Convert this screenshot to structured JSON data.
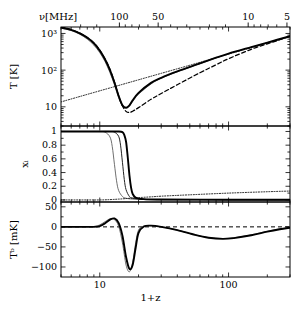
{
  "figure": {
    "type": "multi-panel-line-plot",
    "panels": 3,
    "xlabel": "1+z",
    "top_axis_label": "ν[MHz]"
  },
  "top_axis": {
    "label": "ν[MHz]",
    "ticks": [
      {
        "value": 500,
        "label": "500"
      },
      {
        "value": 100,
        "label": "100"
      },
      {
        "value": 50,
        "label": "50"
      },
      {
        "value": 10,
        "label": "10"
      },
      {
        "value": 5,
        "label": "5"
      }
    ]
  },
  "bottom_axis": {
    "label": "1+z",
    "ticks": [
      {
        "value": 10,
        "label": "10"
      },
      {
        "value": 100,
        "label": "100"
      }
    ],
    "range": [
      5,
      300
    ],
    "scale": "log"
  },
  "chart_data": [
    {
      "type": "line",
      "panel": "top",
      "title": "",
      "ylabel": "T [K]",
      "xlabel": "1+z",
      "xscale": "log",
      "yscale": "log",
      "xlim": [
        5,
        300
      ],
      "ylim": [
        3,
        1500
      ],
      "ytick_labels": [
        "10³",
        "10²",
        "10",
        ""
      ],
      "ytick_values": [
        1000,
        100,
        10,
        3
      ],
      "grid": false,
      "legend": "none",
      "series": [
        {
          "name": "T_CMB",
          "style": "dotted",
          "comment": "CMB temperature, linear in (1+z)",
          "x": [
            5,
            7,
            10,
            15,
            20,
            30,
            50,
            70,
            100,
            150,
            200,
            300
          ],
          "y": [
            13.6,
            19.1,
            27.3,
            40.9,
            54.5,
            81.8,
            136,
            191,
            273,
            409,
            545,
            818
          ]
        },
        {
          "name": "T_K-model-A",
          "style": "solid-thin",
          "comment": "gas kinetic temperature, grey thin line",
          "x": [
            5,
            6,
            7,
            8,
            9,
            10,
            11,
            12,
            13,
            14,
            15,
            16,
            17,
            18,
            20,
            25,
            30,
            40,
            60,
            80,
            100,
            150,
            200,
            300
          ],
          "y": [
            1400,
            1200,
            950,
            700,
            480,
            300,
            170,
            85,
            40,
            18,
            10.5,
            9.0,
            10.5,
            14,
            22,
            42,
            60,
            90,
            150,
            215,
            280,
            420,
            560,
            840
          ]
        },
        {
          "name": "T_K-model-B",
          "style": "solid-thick",
          "comment": "gas kinetic temperature, heavy black line",
          "x": [
            5,
            6,
            7,
            8,
            9,
            10,
            11,
            12,
            13,
            14,
            15,
            16,
            17,
            18,
            20,
            25,
            30,
            40,
            60,
            80,
            100,
            150,
            200,
            300
          ],
          "y": [
            1450,
            1250,
            1000,
            760,
            540,
            340,
            195,
            100,
            46,
            20,
            11,
            9.5,
            11,
            15,
            24,
            45,
            62,
            92,
            152,
            218,
            282,
            425,
            565,
            850
          ]
        },
        {
          "name": "T_K-adiabatic",
          "style": "dashed",
          "comment": "adiabatic cooling, no heating; deepest minimum",
          "x": [
            5,
            6,
            7,
            8,
            9,
            10,
            11,
            12,
            13,
            14,
            15,
            16,
            17,
            18,
            20,
            25,
            30,
            40,
            60,
            80,
            100,
            150,
            200,
            300
          ],
          "y": [
            1500,
            1280,
            1020,
            780,
            550,
            350,
            200,
            105,
            48,
            20,
            10.5,
            7.5,
            7.0,
            7.6,
            9.5,
            16,
            23,
            40,
            85,
            140,
            205,
            370,
            520,
            830
          ]
        }
      ]
    },
    {
      "type": "line",
      "panel": "middle",
      "title": "",
      "ylabel": "xᵢ",
      "xlabel": "1+z",
      "xscale": "log",
      "yscale": "linear",
      "xlim": [
        5,
        300
      ],
      "ylim": [
        -0.03,
        1.08
      ],
      "ytick_labels": [
        "1",
        "0.8",
        "0.6",
        "0.4",
        "0.2",
        "0"
      ],
      "ytick_values": [
        1,
        0.8,
        0.6,
        0.4,
        0.2,
        0
      ],
      "grid": false,
      "legend": "none",
      "series": [
        {
          "name": "x_i-model-A",
          "style": "solid-thin",
          "comment": "ionized fraction, earliest decline",
          "x": [
            5,
            8,
            10,
            11,
            12,
            12.5,
            13,
            13.5,
            14,
            15,
            16,
            18,
            22,
            30,
            60,
            150,
            300
          ],
          "y": [
            1.0,
            1.0,
            1.0,
            0.99,
            0.92,
            0.78,
            0.52,
            0.28,
            0.14,
            0.05,
            0.025,
            0.012,
            0.006,
            0.003,
            0.002,
            0.0015,
            0.001
          ]
        },
        {
          "name": "x_i-model-B",
          "style": "solid-thin2",
          "x": [
            5,
            8,
            10,
            12,
            13,
            14,
            14.5,
            15,
            15.5,
            16,
            17,
            18,
            22,
            30,
            60,
            150,
            300
          ],
          "y": [
            1.0,
            1.0,
            1.0,
            1.0,
            0.99,
            0.93,
            0.8,
            0.55,
            0.3,
            0.15,
            0.05,
            0.025,
            0.01,
            0.005,
            0.003,
            0.002,
            0.0015
          ]
        },
        {
          "name": "x_i-model-C",
          "style": "solid-thick",
          "x": [
            5,
            8,
            10,
            12,
            14,
            15,
            15.5,
            16,
            16.5,
            17,
            17.5,
            18,
            19,
            22,
            30,
            60,
            150,
            300
          ],
          "y": [
            1.0,
            1.0,
            1.0,
            1.0,
            1.0,
            0.99,
            0.95,
            0.85,
            0.62,
            0.36,
            0.18,
            0.09,
            0.035,
            0.012,
            0.006,
            0.004,
            0.003,
            0.002
          ]
        },
        {
          "name": "x_i-residual",
          "style": "dotted",
          "comment": "faint residual electron fraction floor",
          "x": [
            5,
            8,
            10,
            12,
            14,
            16,
            18,
            20,
            25,
            30,
            50,
            100,
            200,
            300
          ],
          "y": [
            0.0,
            0.0,
            0.0,
            0.005,
            0.012,
            0.02,
            0.028,
            0.034,
            0.045,
            0.055,
            0.075,
            0.1,
            0.12,
            0.13
          ]
        }
      ]
    },
    {
      "type": "line",
      "panel": "bottom",
      "title": "",
      "ylabel": "Tᵇ [mK]",
      "xlabel": "1+z",
      "xscale": "log",
      "yscale": "linear",
      "xlim": [
        5,
        300
      ],
      "ylim": [
        -125,
        62
      ],
      "ytick_labels": [
        "50",
        "0",
        "−50",
        "−100"
      ],
      "ytick_values": [
        50,
        0,
        -50,
        -100
      ],
      "grid": false,
      "zero_line": {
        "value": 0,
        "style": "dashed"
      },
      "legend": "none",
      "series": [
        {
          "name": "Tb-model-A",
          "style": "solid-thin",
          "comment": "brightness temperature, thin grey; emission bump then deep absorption trough",
          "x": [
            5,
            7,
            9,
            10,
            11,
            12,
            13,
            14,
            15,
            16,
            17,
            18,
            19,
            20,
            22,
            25,
            30,
            40,
            55,
            70,
            90,
            110,
            150,
            200,
            250,
            300
          ],
          "y": [
            0,
            0,
            1,
            5,
            13,
            20,
            18,
            2,
            -40,
            -95,
            -112,
            -88,
            -40,
            -8,
            2,
            3,
            0,
            -8,
            -20,
            -27,
            -29,
            -27,
            -20,
            -11,
            -5,
            -2
          ]
        },
        {
          "name": "Tb-model-B",
          "style": "solid-thick",
          "comment": "brightness temperature, heavy black",
          "x": [
            5,
            7,
            9,
            10,
            11,
            12,
            13,
            14,
            15,
            16,
            17,
            18,
            19,
            20,
            22,
            25,
            30,
            40,
            55,
            70,
            90,
            110,
            150,
            200,
            250,
            300
          ],
          "y": [
            0,
            0,
            0,
            2,
            9,
            18,
            21,
            10,
            -22,
            -75,
            -105,
            -95,
            -52,
            -15,
            1,
            3,
            0,
            -8,
            -20,
            -27,
            -30,
            -28,
            -21,
            -12,
            -6,
            -2
          ]
        }
      ]
    }
  ]
}
